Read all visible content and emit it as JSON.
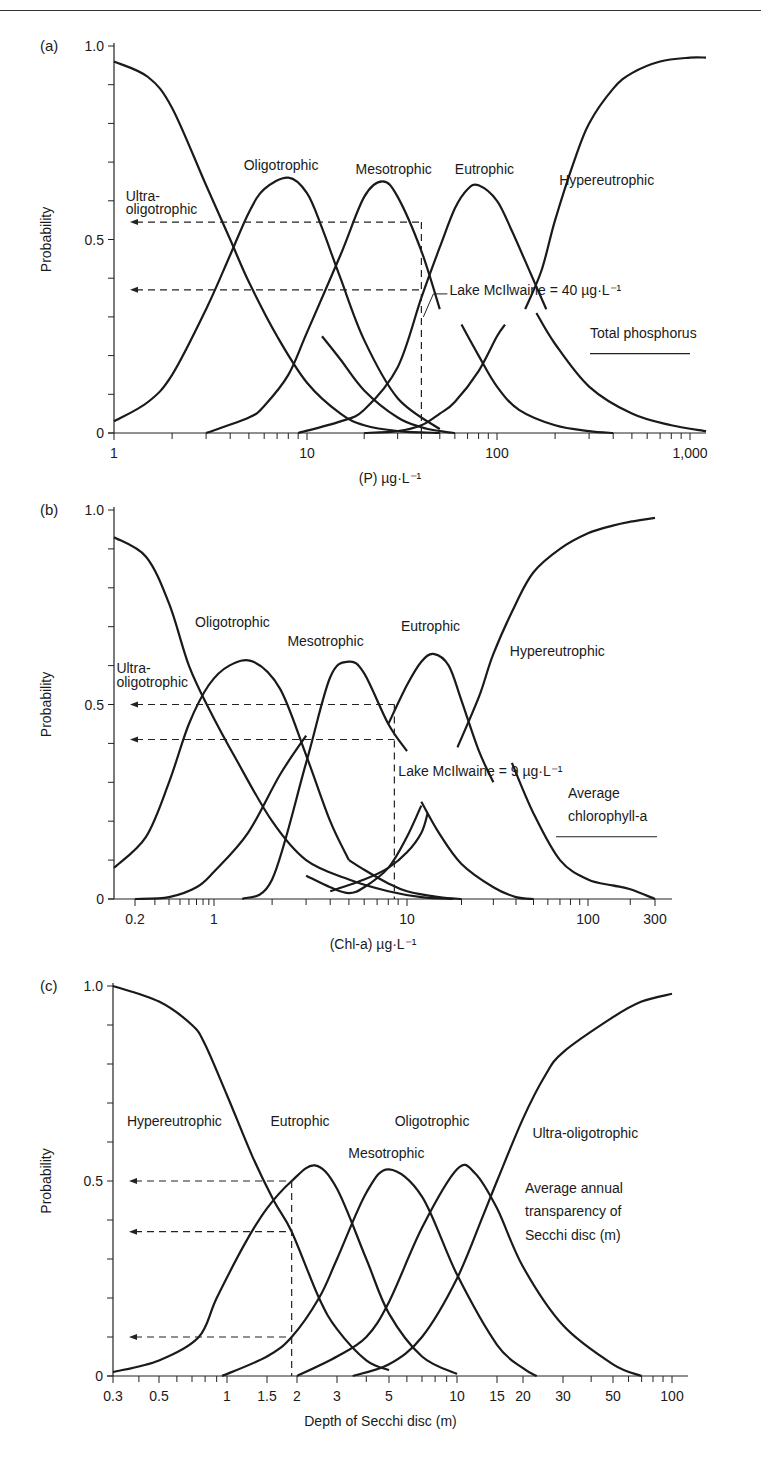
{
  "page": {
    "header_rule": true
  },
  "chart_data": [
    {
      "id": "a",
      "type": "line",
      "panel_label": "(a)",
      "title": "",
      "ylabel": "Probability",
      "xlabel": "(P) µg·L⁻¹",
      "xscale": "log",
      "xlim": [
        1,
        1200
      ],
      "ylim": [
        0,
        1
      ],
      "yticks": [
        0,
        0.1,
        0.2,
        0.3,
        0.4,
        0.5,
        0.6,
        0.7,
        0.8,
        0.9,
        1.0
      ],
      "ytick_labels": {
        "0": "0",
        "0.5": "0.5",
        "1": "1.0"
      },
      "xtick_labels": [
        {
          "v": 1,
          "t": "1"
        },
        {
          "v": 10,
          "t": "10"
        },
        {
          "v": 100,
          "t": "100"
        },
        {
          "v": 1000,
          "t": "1,000"
        }
      ],
      "xminor": [
        2,
        3,
        4,
        5,
        6,
        7,
        8,
        9,
        20,
        30,
        40,
        50,
        60,
        70,
        80,
        90,
        200,
        300,
        400,
        500,
        600,
        700,
        800,
        900
      ],
      "series": [
        {
          "name": "Ultra-oligotrophic",
          "x": [
            1,
            1.5,
            2,
            3,
            4,
            5,
            7,
            10,
            15,
            20,
            30,
            50
          ],
          "y": [
            0.96,
            0.92,
            0.84,
            0.64,
            0.5,
            0.39,
            0.25,
            0.13,
            0.05,
            0.02,
            0.005,
            0
          ]
        },
        {
          "name": "Oligotrophic",
          "x": [
            1,
            1.5,
            2,
            3,
            4,
            5,
            6,
            8,
            10,
            12,
            15,
            20,
            30,
            50
          ],
          "y": [
            0.03,
            0.08,
            0.15,
            0.32,
            0.46,
            0.57,
            0.63,
            0.66,
            0.62,
            0.53,
            0.4,
            0.24,
            0.09,
            0.01
          ]
        },
        {
          "name": "Mesotrophic",
          "x": [
            3,
            5,
            6,
            8,
            10,
            15,
            20,
            25,
            30,
            40,
            50
          ],
          "y": [
            0,
            0.04,
            0.07,
            0.15,
            0.26,
            0.46,
            0.61,
            0.65,
            0.61,
            0.47,
            0.32
          ]
        },
        {
          "name": "Mesotrophic (tail)",
          "x": [
            12,
            15,
            20,
            30,
            40,
            50,
            60
          ],
          "y": [
            0.25,
            0.19,
            0.11,
            0.04,
            0.015,
            0.005,
            0
          ]
        },
        {
          "name": "Eutrophic",
          "x": [
            9,
            15,
            20,
            30,
            40,
            50,
            60,
            70,
            80,
            100,
            120,
            150,
            180
          ],
          "y": [
            0,
            0.03,
            0.06,
            0.17,
            0.35,
            0.48,
            0.58,
            0.63,
            0.64,
            0.6,
            0.52,
            0.41,
            0.32
          ]
        },
        {
          "name": "Eutrophic (tail)",
          "x": [
            65,
            80,
            100,
            130,
            200,
            300,
            400
          ],
          "y": [
            0.28,
            0.2,
            0.12,
            0.06,
            0.02,
            0.005,
            0
          ]
        },
        {
          "name": "Eutrophic-rise (lower)",
          "x": [
            20,
            30,
            40,
            50,
            60,
            80,
            100,
            110
          ],
          "y": [
            0,
            0.005,
            0.02,
            0.05,
            0.08,
            0.16,
            0.25,
            0.28
          ]
        },
        {
          "name": "Hypereutrophic",
          "x": [
            140,
            170,
            200,
            250,
            300,
            400,
            500,
            700,
            1000,
            1200
          ],
          "y": [
            0.32,
            0.42,
            0.55,
            0.7,
            0.8,
            0.89,
            0.93,
            0.96,
            0.97,
            0.97
          ]
        },
        {
          "name": "Hypereutrophic (descending)",
          "x": [
            160,
            200,
            300,
            500,
            800,
            1200
          ],
          "y": [
            0.31,
            0.23,
            0.12,
            0.05,
            0.02,
            0.005
          ]
        }
      ],
      "series_labels": [
        {
          "t": "Ultra-",
          "x": 1.15,
          "y": 0.6
        },
        {
          "t": "oligotrophic",
          "x": 1.15,
          "y": 0.565
        },
        {
          "t": "Oligotrophic",
          "x": 4.7,
          "y": 0.68
        },
        {
          "t": "Mesotrophic",
          "x": 18,
          "y": 0.67
        },
        {
          "t": "Eutrophic",
          "x": 60,
          "y": 0.67
        },
        {
          "t": "Hypereutrophic",
          "x": 210,
          "y": 0.64
        }
      ],
      "reference": {
        "label": "Lake McIlwaine = 40 µg·L⁻¹",
        "x": 40,
        "hlines": [
          0.545,
          0.37
        ]
      },
      "annotation": {
        "t": "Total phosphorus",
        "underline": true
      }
    },
    {
      "id": "b",
      "type": "line",
      "panel_label": "(b)",
      "title": "",
      "ylabel": "Probability",
      "xlabel": "(Chl-a) µg·L⁻¹",
      "xscale": "log",
      "xlim": [
        0.15,
        330
      ],
      "ylim": [
        0,
        1
      ],
      "yticks": [
        0,
        0.1,
        0.2,
        0.3,
        0.4,
        0.5,
        0.6,
        0.7,
        0.8,
        0.9,
        1.0
      ],
      "ytick_labels": {
        "0": "0",
        "0.5": "0.5",
        "1": "1.0"
      },
      "xtick_labels": [
        {
          "v": 0.2,
          "t": "0.2"
        },
        {
          "v": 1,
          "t": "1"
        },
        {
          "v": 10,
          "t": "10"
        },
        {
          "v": 100,
          "t": "100"
        },
        {
          "v": 300,
          "t": "300"
        }
      ],
      "xminor": [
        0.3,
        0.4,
        0.5,
        0.6,
        0.7,
        0.8,
        0.9,
        2,
        3,
        4,
        5,
        6,
        7,
        8,
        9,
        20,
        30,
        40,
        50,
        60,
        70,
        80,
        90,
        200
      ],
      "series": [
        {
          "name": "Ultra-oligotrophic",
          "x": [
            0.15,
            0.25,
            0.4,
            0.6,
            0.9,
            1.3,
            2,
            3,
            5,
            8,
            12,
            18
          ],
          "y": [
            0.93,
            0.88,
            0.76,
            0.6,
            0.49,
            0.36,
            0.2,
            0.1,
            0.05,
            0.02,
            0.005,
            0
          ]
        },
        {
          "name": "Oligotrophic",
          "x": [
            0.15,
            0.25,
            0.4,
            0.6,
            0.9,
            1.2,
            1.6,
            2.2,
            3,
            4,
            5
          ],
          "y": [
            0.08,
            0.16,
            0.3,
            0.45,
            0.55,
            0.6,
            0.61,
            0.54,
            0.37,
            0.2,
            0.1
          ]
        },
        {
          "name": "Oligotrophic (low)",
          "x": [
            0.2,
            0.4,
            0.7,
            1,
            1.5,
            2.2,
            3
          ],
          "y": [
            0,
            0.005,
            0.03,
            0.07,
            0.17,
            0.32,
            0.42
          ]
        },
        {
          "name": "Mesotrophic",
          "x": [
            1.4,
            2,
            3,
            4,
            5,
            6,
            8,
            10
          ],
          "y": [
            0,
            0.05,
            0.35,
            0.57,
            0.61,
            0.58,
            0.45,
            0.38
          ]
        },
        {
          "name": "Mesotrophic (tail)",
          "x": [
            5,
            6,
            8,
            10,
            15,
            20
          ],
          "y": [
            0.1,
            0.075,
            0.04,
            0.02,
            0.005,
            0
          ]
        },
        {
          "name": "Meso-valley",
          "x": [
            3,
            4,
            5,
            6,
            8,
            10,
            12
          ],
          "y": [
            0.06,
            0.03,
            0.015,
            0.03,
            0.08,
            0.16,
            0.24
          ]
        },
        {
          "name": "Eutrophic",
          "x": [
            8,
            10,
            12,
            14,
            17,
            20,
            25,
            30
          ],
          "y": [
            0.45,
            0.55,
            0.61,
            0.63,
            0.6,
            0.51,
            0.38,
            0.3
          ]
        },
        {
          "name": "Eutrophic (rise low)",
          "x": [
            4,
            6,
            8,
            10,
            12,
            13
          ],
          "y": [
            0.02,
            0.05,
            0.08,
            0.12,
            0.17,
            0.22
          ]
        },
        {
          "name": "Eutrophic (tail)",
          "x": [
            12,
            15,
            20,
            30,
            40,
            50
          ],
          "y": [
            0.25,
            0.17,
            0.09,
            0.03,
            0.005,
            0
          ]
        },
        {
          "name": "Hypereutrophic",
          "x": [
            19,
            25,
            30,
            40,
            50,
            70,
            100,
            150,
            200,
            300
          ],
          "y": [
            0.39,
            0.52,
            0.63,
            0.76,
            0.84,
            0.9,
            0.94,
            0.96,
            0.97,
            0.98
          ]
        },
        {
          "name": "Hypereutrophic (descending)",
          "x": [
            38,
            50,
            70,
            100,
            150,
            200,
            300
          ],
          "y": [
            0.35,
            0.22,
            0.1,
            0.05,
            0.035,
            0.025,
            0
          ]
        }
      ],
      "series_labels": [
        {
          "t": "Ultra-",
          "x": 0.155,
          "y": 0.58
        },
        {
          "t": "oligotrophic",
          "x": 0.155,
          "y": 0.545
        },
        {
          "t": "Oligotrophic",
          "x": 0.68,
          "y": 0.7
        },
        {
          "t": "Mesotrophic",
          "x": 2.4,
          "y": 0.65
        },
        {
          "t": "Eutrophic",
          "x": 9.3,
          "y": 0.69
        },
        {
          "t": "Hypereutrophic",
          "x": 37,
          "y": 0.625
        }
      ],
      "reference": {
        "label": "Lake McIlwaine = 9 µg·L⁻¹",
        "x": 8.6,
        "hlines": [
          0.5,
          0.41
        ]
      },
      "annotation": {
        "t1": "Average",
        "t2": "chlorophyll-a",
        "underline": true
      }
    },
    {
      "id": "c",
      "type": "line",
      "panel_label": "(c)",
      "title": "",
      "ylabel": "Probability",
      "xlabel": "Depth of Secchi disc (m)",
      "xscale": "log",
      "xlim": [
        0.3,
        120
      ],
      "ylim": [
        0,
        1
      ],
      "yticks": [
        0,
        0.1,
        0.2,
        0.3,
        0.4,
        0.5,
        0.6,
        0.7,
        0.8,
        0.9,
        1.0
      ],
      "ytick_labels": {
        "0": "0",
        "0.5": "0.5",
        "1": "1.0"
      },
      "xtick_labels": [
        {
          "v": 0.3,
          "t": "0.3"
        },
        {
          "v": 0.5,
          "t": "0.5"
        },
        {
          "v": 1,
          "t": "1"
        },
        {
          "v": 1.5,
          "t": "1.5"
        },
        {
          "v": 2,
          "t": "2"
        },
        {
          "v": 3,
          "t": "3"
        },
        {
          "v": 5,
          "t": "5"
        },
        {
          "v": 10,
          "t": "10"
        },
        {
          "v": 15,
          "t": "15"
        },
        {
          "v": 20,
          "t": "20"
        },
        {
          "v": 30,
          "t": "30"
        },
        {
          "v": 50,
          "t": "50"
        },
        {
          "v": 100,
          "t": "100"
        }
      ],
      "xminor": [
        0.4,
        0.6,
        0.7,
        0.8,
        0.9,
        4,
        6,
        7,
        8,
        9,
        40,
        60,
        70,
        80,
        90
      ],
      "series": [
        {
          "name": "Hypereutrophic",
          "x": [
            0.3,
            0.5,
            0.7,
            0.8,
            1,
            1.3,
            1.6,
            1.9,
            2.5,
            3,
            4,
            5
          ],
          "y": [
            1.0,
            0.96,
            0.9,
            0.85,
            0.72,
            0.56,
            0.45,
            0.37,
            0.2,
            0.12,
            0.04,
            0.015
          ]
        },
        {
          "name": "Eutrophic",
          "x": [
            0.3,
            0.5,
            0.75,
            0.9,
            1.2,
            1.5,
            1.9,
            2.4,
            3,
            4,
            5,
            7,
            10
          ],
          "y": [
            0.01,
            0.04,
            0.1,
            0.2,
            0.34,
            0.43,
            0.5,
            0.54,
            0.48,
            0.3,
            0.16,
            0.05,
            0.005
          ]
        },
        {
          "name": "Mesotrophic",
          "x": [
            0.95,
            1.5,
            1.9,
            2.5,
            3,
            4,
            5,
            7,
            10,
            15,
            20,
            23
          ],
          "y": [
            0,
            0.05,
            0.1,
            0.2,
            0.3,
            0.47,
            0.53,
            0.46,
            0.26,
            0.08,
            0.02,
            0
          ]
        },
        {
          "name": "Oligotrophic",
          "x": [
            2,
            3,
            4,
            5,
            7,
            10,
            12,
            15,
            20,
            30,
            50,
            70
          ],
          "y": [
            0,
            0.05,
            0.1,
            0.19,
            0.38,
            0.53,
            0.52,
            0.43,
            0.28,
            0.13,
            0.03,
            0
          ]
        },
        {
          "name": "Ultra-oligotrophic",
          "x": [
            3.5,
            5,
            7,
            10,
            13,
            15,
            20,
            25,
            30,
            50,
            70,
            100
          ],
          "y": [
            0,
            0.03,
            0.1,
            0.25,
            0.41,
            0.5,
            0.66,
            0.77,
            0.83,
            0.92,
            0.96,
            0.98
          ]
        }
      ],
      "series_labels": [
        {
          "t": "Hypereutrophic",
          "x": 0.35,
          "y": 0.64
        },
        {
          "t": "Eutrophic",
          "x": 1.55,
          "y": 0.64
        },
        {
          "t": "Mesotrophic",
          "x": 3.35,
          "y": 0.56
        },
        {
          "t": "Oligotrophic",
          "x": 5.3,
          "y": 0.64
        },
        {
          "t": "Ultra-oligotrophic",
          "x": 22,
          "y": 0.61
        }
      ],
      "reference": {
        "x": 1.9,
        "hlines": [
          0.5,
          0.37,
          0.1
        ]
      },
      "annotation": {
        "t1": "Average annual",
        "t2": "transparency of",
        "t3": "Secchi disc (m)",
        "underline": false
      }
    }
  ],
  "layout": {
    "panels": [
      {
        "id": "a",
        "x0": 114,
        "x1": 706,
        "y1": 46,
        "y0": 433,
        "xmap": [
          [
            1,
            114
          ],
          [
            10,
            307
          ],
          [
            100,
            497
          ],
          [
            1000,
            690
          ],
          [
            1200,
            706
          ]
        ]
      },
      {
        "id": "b",
        "x0": 114,
        "x1": 672,
        "y1": 510,
        "y0": 899,
        "xmap": [
          [
            0.15,
            114
          ],
          [
            0.2,
            135
          ],
          [
            1,
            214
          ],
          [
            10,
            407
          ],
          [
            100,
            588
          ],
          [
            300,
            655
          ],
          [
            330,
            672
          ]
        ]
      },
      {
        "id": "c",
        "x0": 113,
        "x1": 688,
        "y1": 986,
        "y0": 1376,
        "xmap": [
          [
            0.3,
            113
          ],
          [
            0.5,
            159
          ],
          [
            1,
            227
          ],
          [
            1.5,
            267
          ],
          [
            2,
            297
          ],
          [
            3,
            337
          ],
          [
            5,
            389
          ],
          [
            10,
            457
          ],
          [
            15,
            497
          ],
          [
            20,
            523
          ],
          [
            30,
            563
          ],
          [
            50,
            613
          ],
          [
            100,
            672
          ],
          [
            120,
            688
          ]
        ]
      }
    ]
  }
}
